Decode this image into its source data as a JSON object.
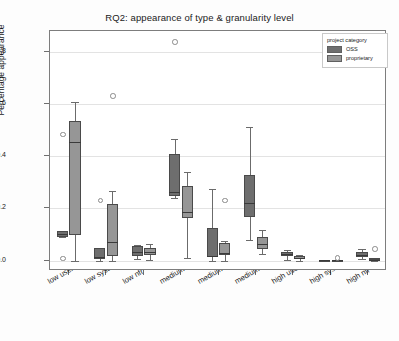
{
  "chart_data": {
    "type": "box",
    "title": "RQ2: appearance of type & granularity level",
    "xlabel": "",
    "ylabel": "Percentage appearance",
    "ylim": [
      -0.04,
      0.88
    ],
    "yticks": [
      "0.0",
      "0.2",
      "0.4",
      "0.6",
      "0.8"
    ],
    "ytick_values": [
      0.0,
      0.2,
      0.4,
      0.6,
      0.8
    ],
    "grid": true,
    "legend": {
      "title": "project category",
      "position": "upper right",
      "entries": [
        {
          "label": "OSS",
          "color": "#6e6e6e"
        },
        {
          "label": "proprietary",
          "color": "#969696"
        }
      ]
    },
    "categories": [
      "low user",
      "low system",
      "low nfr",
      "medium user",
      "medium system",
      "medium nfr",
      "high user",
      "high system",
      "high nfr"
    ],
    "series": [
      {
        "name": "OSS",
        "color": "#6e6e6e",
        "boxes": [
          {
            "category": "low user",
            "whisker_low": 0.09,
            "q1": 0.092,
            "median": 0.1,
            "q3": 0.112,
            "whisker_high": 0.115,
            "outliers": [
              0.485,
              0.01
            ]
          },
          {
            "category": "low system",
            "whisker_low": 0.0,
            "q1": 0.005,
            "median": 0.012,
            "q3": 0.048,
            "whisker_high": 0.05,
            "outliers": [
              0.232
            ]
          },
          {
            "category": "low nfr",
            "whisker_low": 0.005,
            "q1": 0.018,
            "median": 0.033,
            "q3": 0.056,
            "whisker_high": 0.058,
            "outliers": []
          },
          {
            "category": "medium user",
            "whisker_low": 0.238,
            "q1": 0.247,
            "median": 0.262,
            "q3": 0.41,
            "whisker_high": 0.465,
            "outliers": [
              0.84
            ]
          },
          {
            "category": "medium system",
            "whisker_low": 0.0,
            "q1": 0.013,
            "median": 0.017,
            "q3": 0.125,
            "whisker_high": 0.275,
            "outliers": []
          },
          {
            "category": "medium nfr",
            "whisker_low": 0.078,
            "q1": 0.167,
            "median": 0.222,
            "q3": 0.328,
            "whisker_high": 0.512,
            "outliers": []
          },
          {
            "category": "high user",
            "whisker_low": 0.001,
            "q1": 0.018,
            "median": 0.026,
            "q3": 0.034,
            "whisker_high": 0.042,
            "outliers": []
          },
          {
            "category": "high system",
            "whisker_low": 0.0,
            "q1": 0.0,
            "median": 0.001,
            "q3": 0.003,
            "whisker_high": 0.004,
            "outliers": []
          },
          {
            "category": "high nfr",
            "whisker_low": 0.005,
            "q1": 0.014,
            "median": 0.021,
            "q3": 0.031,
            "whisker_high": 0.046,
            "outliers": []
          }
        ]
      },
      {
        "name": "proprietary",
        "color": "#969696",
        "boxes": [
          {
            "category": "low user",
            "whisker_low": 0.0,
            "q1": 0.098,
            "median": 0.455,
            "q3": 0.535,
            "whisker_high": 0.608,
            "outliers": []
          },
          {
            "category": "low system",
            "whisker_low": 0.0,
            "q1": 0.017,
            "median": 0.072,
            "q3": 0.218,
            "whisker_high": 0.265,
            "outliers": [
              0.632
            ]
          },
          {
            "category": "low nfr",
            "whisker_low": 0.001,
            "q1": 0.022,
            "median": 0.034,
            "q3": 0.05,
            "whisker_high": 0.062,
            "outliers": []
          },
          {
            "category": "medium user",
            "whisker_low": 0.01,
            "q1": 0.165,
            "median": 0.186,
            "q3": 0.285,
            "whisker_high": 0.34,
            "outliers": []
          },
          {
            "category": "medium system",
            "whisker_low": 0.0,
            "q1": 0.022,
            "median": 0.03,
            "q3": 0.066,
            "whisker_high": 0.075,
            "outliers": [
              0.232
            ]
          },
          {
            "category": "medium nfr",
            "whisker_low": 0.024,
            "q1": 0.046,
            "median": 0.064,
            "q3": 0.092,
            "whisker_high": 0.117,
            "outliers": []
          },
          {
            "category": "high user",
            "whisker_low": 0.0,
            "q1": 0.006,
            "median": 0.01,
            "q3": 0.018,
            "whisker_high": 0.023,
            "outliers": []
          },
          {
            "category": "high system",
            "whisker_low": 0.0,
            "q1": 0.0,
            "median": 0.001,
            "q3": 0.002,
            "whisker_high": 0.003,
            "outliers": [
              0.011
            ]
          },
          {
            "category": "high nfr",
            "whisker_low": 0.0,
            "q1": 0.002,
            "median": 0.004,
            "q3": 0.008,
            "whisker_high": 0.01,
            "outliers": [
              0.047
            ]
          }
        ]
      }
    ]
  }
}
